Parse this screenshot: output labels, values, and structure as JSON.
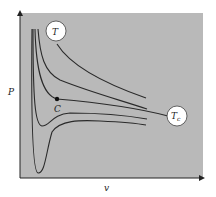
{
  "diagram": {
    "axes": {
      "x_label": "v",
      "y_label": "P"
    },
    "labels": {
      "top_isotherm": "T",
      "critical_isotherm": "T",
      "critical_subscript": "c",
      "critical_point": "C"
    },
    "colors": {
      "panel": "#b9b9b9",
      "curve": "#2a2a2a",
      "bubble_fill": "#ffffff"
    },
    "curves": [
      {
        "name": "isotherm-T-high",
        "description": "highest temperature hyperbola-like isotherm"
      },
      {
        "name": "isotherm-T-above-critical",
        "description": "isotherm above critical temperature"
      },
      {
        "name": "isotherm-Tc",
        "description": "critical isotherm with inflection at C"
      },
      {
        "name": "isotherm-below-critical-1",
        "description": "sub-critical isotherm with shallow dip"
      },
      {
        "name": "isotherm-below-critical-2",
        "description": "sub-critical isotherm with deep dip"
      }
    ]
  }
}
